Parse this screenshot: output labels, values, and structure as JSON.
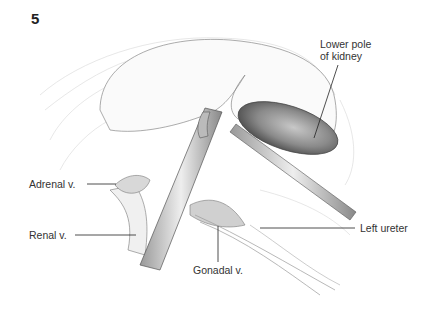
{
  "figure": {
    "number": "5",
    "labels": {
      "lower_pole": [
        "Lower pole",
        "of kidney"
      ],
      "adrenal": "Adrenal v.",
      "renal": "Renal v.",
      "left_ureter": "Left ureter",
      "gonadal": "Gonadal v."
    }
  }
}
